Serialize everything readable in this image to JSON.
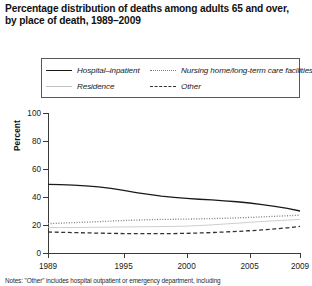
{
  "title": {
    "line1": "Percentage distribution of deaths among adults 65 and over,",
    "line2": "by place of death, 1989–2009"
  },
  "legend": {
    "items": [
      {
        "label": "Hospital–inpatient",
        "style": "solid",
        "color": "#1a1a1a"
      },
      {
        "label": "Nursing home/long-term care facilities",
        "style": "dotted",
        "color": "#7d7d7d"
      },
      {
        "label": "Residence",
        "style": "thin-solid",
        "color": "#c2c2c2"
      },
      {
        "label": "Other",
        "style": "dashed",
        "color": "#333333"
      }
    ]
  },
  "axes": {
    "ylabel": "Percent",
    "yticks": [
      0,
      20,
      40,
      60,
      80,
      100
    ],
    "xticks": [
      1989,
      1995,
      2000,
      2005,
      2009
    ]
  },
  "note": "Notes: \"Other\" includes hospital outpatient or emergency department, including",
  "chart_data": {
    "type": "line",
    "title": "Percentage distribution of deaths among adults 65 and over, by place of death, 1989–2009",
    "xlabel": "",
    "ylabel": "Percent",
    "xlim": [
      1989,
      2009
    ],
    "ylim": [
      0,
      100
    ],
    "grid": false,
    "legend_position": "top",
    "x": [
      1989,
      1990,
      1991,
      1992,
      1993,
      1994,
      1995,
      1996,
      1997,
      1998,
      1999,
      2000,
      2001,
      2002,
      2003,
      2004,
      2005,
      2006,
      2007,
      2008,
      2009
    ],
    "series": [
      {
        "name": "Hospital–inpatient",
        "style": "solid",
        "color": "#1a1a1a",
        "values": [
          49.0,
          48.8,
          48.5,
          48.0,
          47.2,
          46.2,
          44.8,
          43.2,
          41.8,
          40.6,
          39.7,
          39.0,
          38.4,
          37.9,
          37.3,
          36.6,
          35.7,
          34.6,
          33.3,
          31.8,
          30.0
        ]
      },
      {
        "name": "Nursing home/long-term care facilities",
        "style": "dotted",
        "color": "#7d7d7d",
        "values": [
          21.0,
          21.3,
          21.7,
          22.0,
          22.4,
          22.8,
          23.2,
          23.5,
          23.8,
          24.0,
          24.1,
          24.2,
          24.4,
          24.6,
          24.8,
          25.1,
          25.4,
          25.8,
          26.2,
          26.6,
          27.0
        ]
      },
      {
        "name": "Residence",
        "style": "thin-solid",
        "color": "#c2c2c2",
        "values": [
          18.3,
          18.2,
          18.2,
          18.3,
          18.4,
          18.5,
          18.6,
          18.7,
          18.8,
          18.9,
          19.0,
          19.2,
          19.6,
          20.1,
          20.7,
          21.3,
          21.9,
          22.5,
          23.0,
          23.5,
          24.0
        ]
      },
      {
        "name": "Other",
        "style": "dashed",
        "color": "#333333",
        "values": [
          15.0,
          14.8,
          14.6,
          14.4,
          14.2,
          14.0,
          13.9,
          13.8,
          13.8,
          13.8,
          13.9,
          14.0,
          14.3,
          14.6,
          15.0,
          15.4,
          15.9,
          16.5,
          17.2,
          18.0,
          19.0
        ]
      }
    ]
  }
}
